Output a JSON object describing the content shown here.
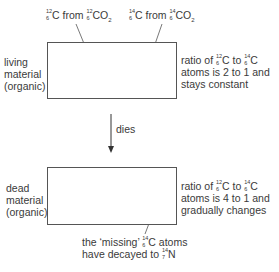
{
  "top_labels": {
    "c12": {
      "mass": "12",
      "atomic": "6",
      "el": "C",
      "mid": " from ",
      "mass2": "12",
      "atomic2": "6",
      "el2": "CO",
      "sub": "2"
    },
    "c14": {
      "mass": "14",
      "atomic": "6",
      "el": "C",
      "mid": " from ",
      "mass2": "14",
      "atomic2": "6",
      "el2": "CO",
      "sub": "2"
    }
  },
  "living": {
    "label_lines": [
      "living",
      "material",
      "(organic)"
    ],
    "ratio": {
      "l1a": "ratio of ",
      "m1": "12",
      "z1": "6",
      "e1": "C to ",
      "m2": "14",
      "z2": "6",
      "e2": "C",
      "l2": "atoms is 2 to 1 and",
      "l3": "stays constant"
    },
    "grid": {
      "rows": 4,
      "c12_cols": 6,
      "c14_cols": 3
    }
  },
  "arrow": {
    "label": "dies"
  },
  "dead": {
    "label_lines": [
      "dead",
      "material",
      "(organic)"
    ],
    "ratio": {
      "l1a": "ratio of ",
      "m1": "12",
      "z1": "6",
      "e1": "C to ",
      "m2": "14",
      "z2": "6",
      "e2": "C",
      "l2": "atoms is 4 to 1 and",
      "l3": "gradually changes"
    },
    "grid": {
      "rows": 4,
      "c12_cols": 6,
      "c14_remaining": "3 in first row, 1 in each other row"
    }
  },
  "note": {
    "l1a": "the ‘missing’ ",
    "m1": "14",
    "z1": "6",
    "e1": "C atoms",
    "l2a": "have decayed to ",
    "m2": "14",
    "z2": "7",
    "e2": "N"
  },
  "colors": {
    "dot": "#8a8a8a",
    "line": "#555555",
    "text": "#3a3a3a"
  }
}
